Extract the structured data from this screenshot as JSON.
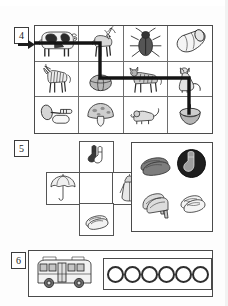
{
  "worksheet": {
    "page_background": "#fdfdfd",
    "ink_color": "#2e2e2e"
  },
  "exercises": [
    {
      "number": "4",
      "type": "maze-grid",
      "rows": 3,
      "columns": 4,
      "entry": "left-arrow-row-1",
      "cells": [
        {
          "row": 1,
          "col": 1,
          "icon": "cow-icon",
          "label": "cow"
        },
        {
          "row": 1,
          "col": 2,
          "icon": "deer-icon",
          "label": "deer"
        },
        {
          "row": 1,
          "col": 3,
          "icon": "beetle-icon",
          "label": "beetle"
        },
        {
          "row": 1,
          "col": 4,
          "icon": "barrel-icon",
          "label": "barrel"
        },
        {
          "row": 2,
          "col": 1,
          "icon": "zebra-icon",
          "label": "zebra"
        },
        {
          "row": 2,
          "col": 2,
          "icon": "ball-icon",
          "label": "ball"
        },
        {
          "row": 2,
          "col": 3,
          "icon": "tiger-icon",
          "label": "tiger"
        },
        {
          "row": 2,
          "col": 4,
          "icon": "cat-icon",
          "label": "cat"
        },
        {
          "row": 3,
          "col": 1,
          "icon": "horn-icon",
          "label": "horn"
        },
        {
          "row": 3,
          "col": 2,
          "icon": "mushroom-icon",
          "label": "mushroom"
        },
        {
          "row": 3,
          "col": 3,
          "icon": "mouse-icon",
          "label": "mouse"
        },
        {
          "row": 3,
          "col": 4,
          "icon": "spinning-top-icon",
          "label": "spinning top"
        }
      ],
      "path": "enters at row 1 left, right to col 2, down to row 2, right to col 4, down to row 3"
    },
    {
      "number": "5",
      "type": "cross-layout",
      "cross_items": [
        {
          "position": "top",
          "icon": "socks-icon",
          "label": "socks"
        },
        {
          "position": "left",
          "icon": "umbrella-icon",
          "label": "umbrella"
        },
        {
          "position": "center",
          "icon": "empty-cell",
          "label": ""
        },
        {
          "position": "right",
          "icon": "raincoat-icon",
          "label": "raincoat"
        },
        {
          "position": "bottom",
          "icon": "slippers-icon",
          "label": "slippers"
        }
      ],
      "answer_box_items": [
        {
          "icon": "loafers-icon",
          "label": "loafers"
        },
        {
          "icon": "sock-circle-icon",
          "label": "sock in circle"
        },
        {
          "icon": "high-heels-icon",
          "label": "high heels"
        },
        {
          "icon": "sandals-icon",
          "label": "sandals"
        }
      ]
    },
    {
      "number": "6",
      "type": "count-row",
      "subject": {
        "icon": "bus-icon",
        "label": "bus"
      },
      "rings_count": 6,
      "rings": [
        "ring",
        "ring",
        "ring",
        "ring",
        "ring",
        "ring"
      ]
    }
  ]
}
